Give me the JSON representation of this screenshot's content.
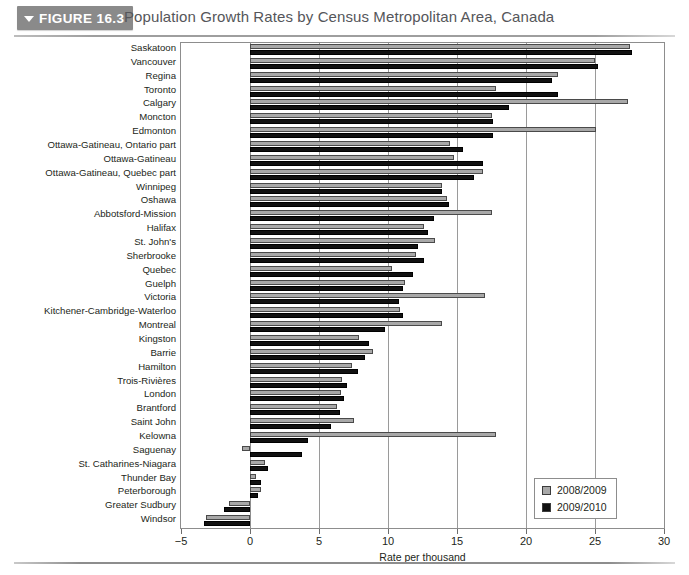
{
  "figure": {
    "badge_label": "FIGURE 16.3",
    "title": "Population Growth Rates by Census Metropolitan Area, Canada",
    "collapse_icon": "triangle-down-icon"
  },
  "legend": {
    "position": "bottom-right",
    "items": [
      {
        "label": "2008/2009",
        "color": "#a8a8a8"
      },
      {
        "label": "2009/2010",
        "color": "#111111"
      }
    ]
  },
  "chart_data": {
    "type": "bar",
    "orientation": "horizontal",
    "title": "Population Growth Rates by Census Metropolitan Area, Canada",
    "xlabel": "Rate per thousand",
    "ylabel": "",
    "xlim": [
      -5,
      30
    ],
    "xticks": [
      -5,
      0,
      5,
      10,
      15,
      20,
      25,
      30
    ],
    "xtick_labels": [
      "−5",
      "0",
      "5",
      "10",
      "15",
      "20",
      "25",
      "30"
    ],
    "grid": true,
    "categories": [
      "Saskatoon",
      "Vancouver",
      "Regina",
      "Toronto",
      "Calgary",
      "Moncton",
      "Edmonton",
      "Ottawa-Gatineau, Ontario part",
      "Ottawa-Gatineau",
      "Ottawa-Gatineau, Quebec part",
      "Winnipeg",
      "Oshawa",
      "Abbotsford-Mission",
      "Halifax",
      "St. John's",
      "Sherbrooke",
      "Quebec",
      "Guelph",
      "Victoria",
      "Kitchener-Cambridge-Waterloo",
      "Montreal",
      "Kingston",
      "Barrie",
      "Hamilton",
      "Trois-Rivières",
      "London",
      "Brantford",
      "Saint John",
      "Kelowna",
      "Saguenay",
      "St. Catharines-Niagara",
      "Thunder Bay",
      "Peterborough",
      "Greater Sudbury",
      "Windsor"
    ],
    "series": [
      {
        "name": "2008/2009",
        "color": "#a8a8a8",
        "values": [
          27.5,
          25.0,
          22.3,
          17.8,
          27.4,
          17.5,
          25.1,
          14.5,
          14.8,
          16.9,
          13.9,
          14.3,
          17.5,
          12.6,
          13.4,
          12.0,
          10.3,
          11.2,
          17.0,
          10.9,
          13.9,
          7.9,
          8.9,
          7.4,
          6.7,
          6.6,
          6.3,
          7.5,
          17.8,
          -0.6,
          1.1,
          0.4,
          0.8,
          -1.5,
          -3.2
        ]
      },
      {
        "name": "2009/2010",
        "color": "#111111",
        "values": [
          27.7,
          25.2,
          21.9,
          22.3,
          18.8,
          17.6,
          17.6,
          15.4,
          16.9,
          16.2,
          13.9,
          14.4,
          13.3,
          12.9,
          12.2,
          12.6,
          11.8,
          11.1,
          10.8,
          11.1,
          9.8,
          8.6,
          8.3,
          7.8,
          7.0,
          6.8,
          6.5,
          5.9,
          4.2,
          3.8,
          1.3,
          0.8,
          0.6,
          -1.9,
          -3.3
        ]
      }
    ]
  }
}
